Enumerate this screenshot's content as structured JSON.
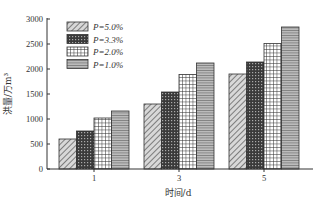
{
  "chart_data": {
    "type": "bar",
    "title": "",
    "xlabel": "时间/d",
    "ylabel": "洪量/万m³",
    "categories": [
      "1",
      "3",
      "5"
    ],
    "series": [
      {
        "name": "P=5.0%",
        "pattern": "diagonal-hatch",
        "values": [
          600,
          1300,
          1900
        ]
      },
      {
        "name": "P=3.3%",
        "pattern": "crosshatch-dark",
        "values": [
          760,
          1540,
          2140
        ]
      },
      {
        "name": "P=2.0%",
        "pattern": "grid",
        "values": [
          1020,
          1890,
          2510
        ]
      },
      {
        "name": "P=1.0%",
        "pattern": "horizontal-lines",
        "values": [
          1160,
          2120,
          2840
        ]
      }
    ],
    "ylim": [
      0,
      3000
    ],
    "yticks": [
      0,
      500,
      1000,
      1500,
      2000,
      2500,
      3000
    ],
    "grid": false,
    "legend_position": "upper-left"
  }
}
